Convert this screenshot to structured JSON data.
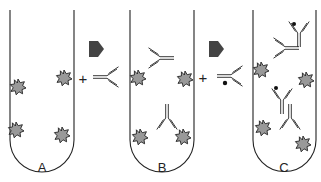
{
  "figure": {
    "type": "antibody-antigen binding sequence diagram",
    "colors": {
      "outline": "#222222",
      "antigen_fill": "#999999",
      "arrow": "#444444",
      "background": "#ffffff"
    },
    "tubes": [
      {
        "label": "A",
        "content": "antigens attached to tube wall"
      },
      {
        "label": "B",
        "content": "primary antibodies bound to antigens"
      },
      {
        "label": "C",
        "content": "labeled secondary antibodies bound to primary antibodies"
      }
    ],
    "steps": [
      {
        "symbol": "+",
        "reagent": "primary antibody"
      },
      {
        "symbol": "+",
        "reagent": "labeled secondary antibody"
      }
    ]
  }
}
